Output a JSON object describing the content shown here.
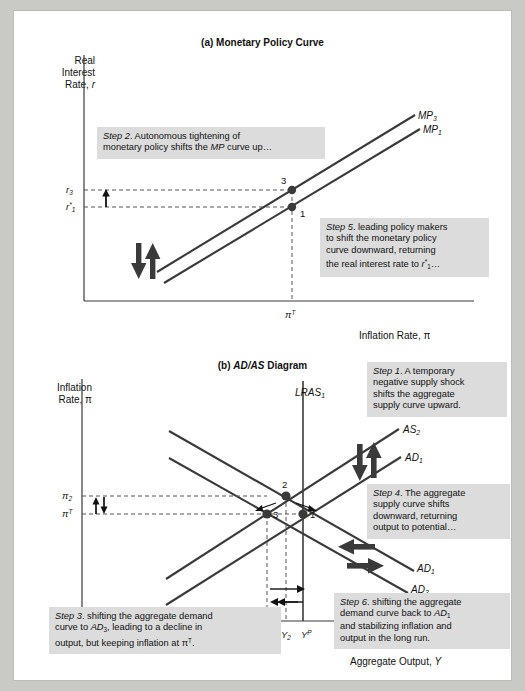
{
  "figure": {
    "panel_a": {
      "title_prefix": "(a) ",
      "title": "Monetary Policy Curve",
      "y_axis_label_line1": "Real",
      "y_axis_label_line2": "Interest",
      "y_axis_label_line3": "Rate, r",
      "x_axis_label": "Inflation Rate, π",
      "x_tick_label": "π",
      "x_tick_sup": "T",
      "y_tick_labels": [
        {
          "base": "r",
          "sub": "3",
          "star": false
        },
        {
          "base": "r",
          "sub": "1",
          "star": true
        }
      ],
      "curves": [
        {
          "name": "MP",
          "sub": "3"
        },
        {
          "name": "MP",
          "sub": "1"
        }
      ],
      "points": [
        "3",
        "1"
      ],
      "callouts": [
        {
          "id": "step2",
          "step": "Step 2",
          "lines": [
            ". Autonomous tightening of",
            "monetary policy shifts the MP curve up…"
          ]
        },
        {
          "id": "step5",
          "step": "Step 5",
          "lines": [
            ". leading policy makers",
            "to shift the monetary policy",
            "curve downward, returning",
            "the real interest rate to r*₁…"
          ]
        }
      ]
    },
    "panel_b": {
      "title_prefix": "(b) ",
      "title_italic": "AD/AS",
      "title_suffix": " Diagram",
      "y_axis_label_line1": "Inflation",
      "y_axis_label_line2": "Rate, π",
      "x_axis_label": "Aggregate Output, Y",
      "y_tick_labels": [
        {
          "base": "π",
          "sub": "2",
          "sup": ""
        },
        {
          "base": "π",
          "sub": "",
          "sup": "T"
        }
      ],
      "x_tick_labels": [
        {
          "base": "Y",
          "sub": "3",
          "sup": ""
        },
        {
          "base": "Y",
          "sub": "2",
          "sup": ""
        },
        {
          "base": "Y",
          "sub": "",
          "sup": "P"
        }
      ],
      "curves": [
        {
          "name": "LRAS",
          "sub": "1"
        },
        {
          "name": "AS",
          "sub": "2"
        },
        {
          "name": "AS",
          "sub": "1"
        },
        {
          "name": "AD",
          "sub": "1"
        },
        {
          "name": "AD",
          "sub": "3"
        }
      ],
      "points": [
        "2",
        "3",
        "1"
      ],
      "callouts": [
        {
          "id": "step1",
          "step": "Step 1",
          "lines": [
            ". A temporary",
            "negative supply shock",
            "shifts the aggregate",
            "supply curve upward."
          ]
        },
        {
          "id": "step4",
          "step": "Step 4",
          "lines": [
            ". The aggregate",
            "supply curve shifts",
            "downward, returning",
            "output to potential…"
          ]
        },
        {
          "id": "step3",
          "step": "Step 3",
          "lines": [
            ". shifting the aggregate demand",
            "curve to AD₃, leading to a decline in",
            "output, but keeping inflation at πᵀ."
          ]
        },
        {
          "id": "step6",
          "step": "Step 6",
          "lines": [
            ". shifting the aggregate",
            "demand curve back to AD₁",
            "and stabilizing inflation and",
            "output in the long run."
          ]
        }
      ]
    },
    "colors": {
      "line": "#3a3a3a",
      "callout_bg": "#dcdcdc",
      "page_bg": "#ffffff",
      "outer_bg": "#c9c9c5",
      "text": "#111111"
    }
  }
}
